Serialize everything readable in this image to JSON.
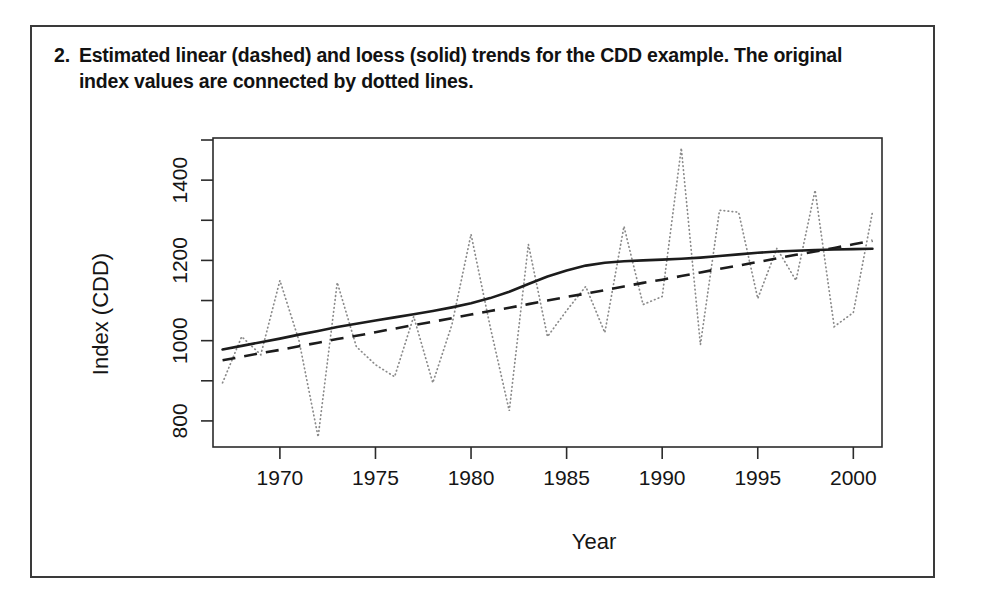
{
  "figure": {
    "caption_number": "2.",
    "caption_text": "Estimated linear (dashed) and loess (solid) trends for the CDD example. The original index values are connected by dotted lines."
  },
  "chart_data": {
    "type": "line",
    "title": "",
    "xlabel": "Year",
    "ylabel": "Index (CDD)",
    "xlim": [
      1966.5,
      2001.5
    ],
    "ylim": [
      735,
      1505
    ],
    "grid": false,
    "legend_position": "none",
    "x_ticks": [
      1970,
      1975,
      1980,
      1985,
      1990,
      1995,
      2000
    ],
    "x_minor_ticks": [],
    "y_ticks": [
      800,
      1000,
      1200,
      1400
    ],
    "y_minor_ticks": [
      900,
      1100,
      1300,
      1500
    ],
    "x": [
      1967,
      1968,
      1969,
      1970,
      1971,
      1972,
      1973,
      1974,
      1975,
      1976,
      1977,
      1978,
      1979,
      1980,
      1981,
      1982,
      1983,
      1984,
      1985,
      1986,
      1987,
      1988,
      1989,
      1990,
      1991,
      1992,
      1993,
      1994,
      1995,
      1996,
      1997,
      1998,
      1999,
      2000,
      2001
    ],
    "series": [
      {
        "name": "Original index values",
        "style": "dotted",
        "color": "#8a8a8a",
        "values": [
          895,
          1010,
          965,
          1150,
          1000,
          760,
          1145,
          985,
          940,
          910,
          1060,
          895,
          1040,
          1265,
          1035,
          825,
          1240,
          1010,
          1075,
          1135,
          1020,
          1285,
          1090,
          1110,
          1480,
          990,
          1325,
          1320,
          1105,
          1230,
          1150,
          1375,
          1035,
          1070,
          1320
        ]
      },
      {
        "name": "Loess trend",
        "style": "solid",
        "color": "#1c1c1c",
        "values": [
          978,
          987,
          996,
          1005,
          1015,
          1024,
          1034,
          1042,
          1050,
          1058,
          1066,
          1074,
          1083,
          1093,
          1106,
          1122,
          1141,
          1160,
          1175,
          1187,
          1194,
          1198,
          1200,
          1202,
          1204,
          1207,
          1211,
          1215,
          1219,
          1222,
          1224,
          1226,
          1227,
          1228,
          1229
        ]
      },
      {
        "name": "Linear trend",
        "style": "dashed",
        "color": "#1c1c1c",
        "values": [
          951,
          960,
          969,
          977,
          986,
          995,
          1004,
          1012,
          1021,
          1030,
          1039,
          1047,
          1056,
          1065,
          1074,
          1082,
          1091,
          1100,
          1109,
          1117,
          1126,
          1135,
          1144,
          1152,
          1161,
          1170,
          1179,
          1187,
          1196,
          1205,
          1214,
          1222,
          1231,
          1240,
          1249
        ]
      }
    ]
  }
}
